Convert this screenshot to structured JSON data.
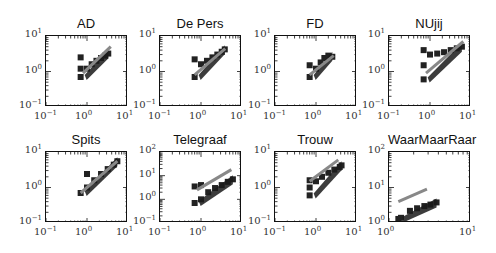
{
  "chart_data": [
    {
      "type": "scatter",
      "title": "AD",
      "xscale": "log",
      "yscale": "log",
      "xlim": [
        0.1,
        10
      ],
      "ylim": [
        0.1,
        10
      ],
      "xticks": [
        "10^-1",
        "10^0",
        "10^1"
      ],
      "yticks": [
        "10^-1",
        "10^0",
        "10^1"
      ],
      "series": [
        {
          "name": "observed",
          "marker": "square",
          "color": "#222222",
          "x": [
            0.7,
            0.7,
            0.7,
            1.0,
            1.3,
            1.7,
            2.2,
            2.8,
            3.3
          ],
          "y": [
            0.7,
            1.2,
            2.5,
            1.2,
            1.6,
            2.0,
            2.4,
            2.8,
            3.2
          ]
        },
        {
          "name": "fit",
          "type": "line",
          "color": "#888888",
          "x": [
            0.8,
            3.8
          ],
          "y": [
            0.9,
            5.0
          ]
        }
      ]
    },
    {
      "type": "scatter",
      "title": "De Pers",
      "xscale": "log",
      "yscale": "log",
      "xlim": [
        0.1,
        10
      ],
      "ylim": [
        0.1,
        10
      ],
      "xticks": [
        "10^-1",
        "10^0",
        "10^1"
      ],
      "yticks": [
        "10^-1",
        "10^0",
        "10^1"
      ],
      "series": [
        {
          "name": "observed",
          "marker": "square",
          "color": "#222222",
          "x": [
            0.7,
            0.7,
            1.0,
            1.4,
            1.9,
            2.5,
            3.2,
            3.8
          ],
          "y": [
            0.7,
            2.2,
            1.6,
            2.0,
            2.5,
            3.0,
            3.6,
            4.2
          ]
        },
        {
          "name": "fit",
          "type": "line",
          "color": "#888888",
          "x": [
            0.7,
            3.9
          ],
          "y": [
            0.8,
            4.4
          ]
        }
      ]
    },
    {
      "type": "scatter",
      "title": "FD",
      "xscale": "log",
      "yscale": "log",
      "xlim": [
        0.1,
        10
      ],
      "ylim": [
        0.1,
        10
      ],
      "xticks": [
        "10^-1",
        "10^0",
        "10^1"
      ],
      "yticks": [
        "10^-1",
        "10^0",
        "10^1"
      ],
      "series": [
        {
          "name": "observed",
          "marker": "square",
          "color": "#222222",
          "x": [
            0.7,
            0.7,
            1.0,
            1.3,
            1.6,
            2.0,
            2.5
          ],
          "y": [
            0.7,
            1.5,
            1.2,
            1.8,
            2.4,
            2.8,
            2.6
          ]
        },
        {
          "name": "fit",
          "type": "line",
          "color": "#888888",
          "x": [
            0.7,
            2.7
          ],
          "y": [
            0.8,
            2.8
          ]
        }
      ]
    },
    {
      "type": "scatter",
      "title": "NUjij",
      "xscale": "log",
      "yscale": "log",
      "xlim": [
        0.1,
        10
      ],
      "ylim": [
        0.1,
        10
      ],
      "xticks": [
        "10^-1",
        "10^0",
        "10^1"
      ],
      "yticks": [
        "10^-1",
        "10^0",
        "10^1"
      ],
      "series": [
        {
          "name": "observed",
          "marker": "square",
          "color": "#222222",
          "x": [
            0.7,
            0.7,
            0.7,
            1.0,
            1.5,
            2.2,
            3.2,
            4.5,
            6.0
          ],
          "y": [
            0.6,
            1.5,
            4.0,
            3.0,
            3.2,
            3.5,
            4.0,
            4.5,
            5.0
          ]
        },
        {
          "name": "fit",
          "type": "line",
          "color": "#888888",
          "x": [
            0.8,
            6.5
          ],
          "y": [
            0.9,
            7.0
          ]
        }
      ]
    },
    {
      "type": "scatter",
      "title": "Spits",
      "xscale": "log",
      "yscale": "log",
      "xlim": [
        0.1,
        10
      ],
      "ylim": [
        0.1,
        10
      ],
      "xticks": [
        "10^-1",
        "10^0",
        "10^1"
      ],
      "yticks": [
        "10^-1",
        "10^0",
        "10^1"
      ],
      "series": [
        {
          "name": "observed",
          "marker": "square",
          "color": "#222222",
          "x": [
            0.7,
            1.0,
            1.0,
            1.5,
            2.2,
            3.2,
            4.5,
            5.5
          ],
          "y": [
            0.7,
            1.0,
            2.4,
            1.6,
            2.4,
            3.3,
            4.4,
            5.5
          ]
        },
        {
          "name": "fit",
          "type": "line",
          "color": "#888888",
          "x": [
            0.7,
            5.5
          ],
          "y": [
            0.7,
            5.5
          ]
        }
      ]
    },
    {
      "type": "scatter",
      "title": "Telegraaf",
      "xscale": "log",
      "yscale": "log",
      "xlim": [
        0.1,
        10
      ],
      "ylim": [
        0.1,
        100
      ],
      "xticks": [
        "10^-1",
        "10^0",
        "10^1"
      ],
      "yticks": [
        "10^-1",
        "10^0",
        "10^1",
        "10^2"
      ],
      "series": [
        {
          "name": "observed",
          "marker": "square",
          "color": "#222222",
          "x": [
            0.7,
            0.7,
            1.0,
            1.0,
            1.5,
            2.2,
            3.2,
            4.5,
            6.0
          ],
          "y": [
            0.7,
            3.5,
            1.0,
            4.0,
            2.0,
            3.0,
            4.0,
            5.5,
            7.0
          ]
        },
        {
          "name": "fit",
          "type": "line",
          "color": "#888888",
          "x": [
            0.8,
            5.5
          ],
          "y": [
            2.5,
            18.0
          ]
        }
      ]
    },
    {
      "type": "scatter",
      "title": "Trouw",
      "xscale": "log",
      "yscale": "log",
      "xlim": [
        0.1,
        10
      ],
      "ylim": [
        0.1,
        10
      ],
      "xticks": [
        "10^-1",
        "10^0",
        "10^1"
      ],
      "yticks": [
        "10^-1",
        "10^0",
        "10^1"
      ],
      "series": [
        {
          "name": "observed",
          "marker": "square",
          "color": "#222222",
          "x": [
            0.7,
            0.7,
            0.7,
            1.0,
            1.4,
            2.0,
            2.8,
            3.8,
            4.2
          ],
          "y": [
            0.6,
            1.0,
            1.6,
            1.5,
            2.0,
            2.6,
            3.2,
            3.8,
            4.2
          ]
        },
        {
          "name": "fit",
          "type": "line",
          "color": "#888888",
          "x": [
            0.7,
            3.5
          ],
          "y": [
            1.5,
            6.0
          ]
        }
      ]
    },
    {
      "type": "scatter",
      "title": "WaarMaarRaar",
      "xscale": "log",
      "yscale": "log",
      "xlim": [
        1,
        10
      ],
      "ylim": [
        1,
        100
      ],
      "xticks": [
        "10^0",
        "10^1"
      ],
      "yticks": [
        "10^0",
        "10^1",
        "10^2"
      ],
      "series": [
        {
          "name": "observed",
          "marker": "square",
          "color": "#222222",
          "x": [
            1.3,
            1.4,
            1.8,
            2.2,
            2.7,
            3.2,
            3.8
          ],
          "y": [
            1.3,
            1.4,
            2.2,
            2.6,
            3.0,
            3.3,
            3.8
          ]
        },
        {
          "name": "fit",
          "type": "line",
          "color": "#888888",
          "x": [
            1.3,
            2.9
          ],
          "y": [
            4.0,
            9.0
          ]
        }
      ]
    }
  ],
  "panels": [
    {
      "title": "AD"
    },
    {
      "title": "De Pers"
    },
    {
      "title": "FD"
    },
    {
      "title": "NUjij"
    },
    {
      "title": "Spits"
    },
    {
      "title": "Telegraaf"
    },
    {
      "title": "Trouw"
    },
    {
      "title": "WaarMaarRaar"
    }
  ],
  "colors": {
    "points": "#222222",
    "fit": "#888888",
    "frame": "#111111"
  }
}
